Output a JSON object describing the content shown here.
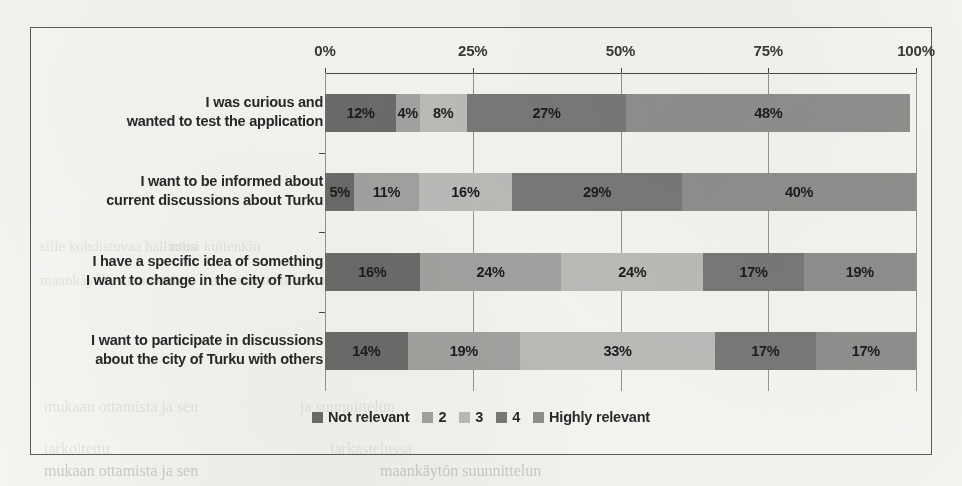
{
  "chart_data": {
    "type": "bar",
    "orientation": "horizontal",
    "stacked": true,
    "normalized_percent": true,
    "title": "",
    "xlabel": "",
    "ylabel": "",
    "xlim": [
      0,
      100
    ],
    "grid": true,
    "legend_position": "bottom",
    "x_tick_labels": [
      "0%",
      "25%",
      "50%",
      "75%",
      "100%"
    ],
    "x_ticks": [
      0,
      25,
      50,
      75,
      100
    ],
    "categories": [
      "I was curious and wanted to test the application",
      "I want to be informed about current discussions about Turku",
      "I have a specific idea of something I want to change in the city of Turku",
      "I want to participate in discussions about the city of Turku with others"
    ],
    "category_lines": [
      [
        "I was curious and",
        "wanted to test the application"
      ],
      [
        "I want to be informed about",
        "current discussions about Turku"
      ],
      [
        "I have a specific idea of something",
        "I want to change in the city of Turku"
      ],
      [
        "I want to participate in discussions",
        "about the city of Turku with others"
      ]
    ],
    "series": [
      {
        "name": "Not relevant",
        "color": "#6f6f6f",
        "values": [
          12,
          5,
          16,
          14
        ]
      },
      {
        "name": "2",
        "color": "#a8a8a8",
        "values": [
          4,
          11,
          24,
          19
        ]
      },
      {
        "name": "3",
        "color": "#c2c2c2",
        "values": [
          8,
          16,
          24,
          33
        ]
      },
      {
        "name": "4",
        "color": "#7d7d7d",
        "values": [
          27,
          29,
          17,
          17
        ]
      },
      {
        "name": "Highly relevant",
        "color": "#949494",
        "values": [
          48,
          40,
          19,
          17
        ]
      }
    ],
    "data_labels": [
      [
        "12%",
        "4%",
        "8%",
        "27%",
        "48%"
      ],
      [
        "5%",
        "11%",
        "16%",
        "29%",
        "40%"
      ],
      [
        "16%",
        "24%",
        "24%",
        "17%",
        "19%"
      ],
      [
        "14%",
        "19%",
        "33%",
        "17%",
        "17%"
      ]
    ],
    "legend": [
      "Not relevant",
      "2",
      "3",
      "4",
      "Highly relevant"
    ]
  },
  "background_text": {
    "line1": "sille kohdistuvaa hallintoa",
    "line2": "tulisi kuitenkin",
    "line3": "maankäytön suunnittelun",
    "line4": "ennemmin kuin nyt",
    "line5": "mukaan ottamista ja sen",
    "line6": "ja suunnittelun",
    "line7": "tarkoitettu",
    "line8": "tarkastelussa"
  }
}
